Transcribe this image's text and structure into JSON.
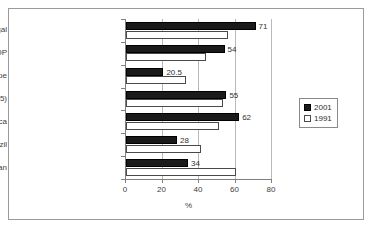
{
  "chart_data": {
    "type": "bar",
    "orientation": "horizontal",
    "title": "",
    "xlabel": "%",
    "ylabel": "",
    "xlim": [
      0,
      80
    ],
    "xticks": [
      "0",
      "20",
      "40",
      "60",
      "80"
    ],
    "grid": true,
    "legend_position": "right",
    "categories": [
      "Portugal",
      "PALOP",
      "Eastern Europe",
      "European Union (15)",
      "North America",
      "Brazil",
      "China, India & Pakistan"
    ],
    "series": [
      {
        "name": "2001",
        "color": "#1a1a1a",
        "values": [
          71,
          54,
          20.5,
          55,
          62,
          28,
          34
        ],
        "labels": [
          "71",
          "54",
          "20.5",
          "55",
          "62",
          "28",
          "34"
        ]
      },
      {
        "name": "1991",
        "color": "#ffffff",
        "values": [
          56,
          44,
          33,
          53,
          51,
          41,
          60
        ],
        "labels": [
          "",
          "",
          "",
          "",
          "",
          "",
          ""
        ]
      }
    ]
  },
  "legend": {
    "items": [
      {
        "label": "2001",
        "key": "s2001"
      },
      {
        "label": "1991",
        "key": "s1991"
      }
    ]
  }
}
